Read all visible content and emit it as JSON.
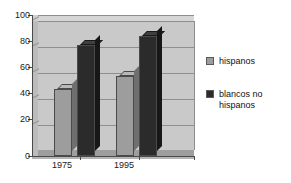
{
  "chart_data": {
    "type": "bar",
    "title": "",
    "subtitle": "",
    "xlabel": "",
    "ylabel": "",
    "categories": [
      "1975",
      "1995"
    ],
    "series": [
      {
        "name": "hispanos",
        "values": [
          52,
          62
        ],
        "color": "#9d9d9d"
      },
      {
        "name": "blancos no hispanos",
        "values": [
          86,
          93
        ],
        "color": "#2b2b2b"
      }
    ],
    "ylim": [
      0,
      100
    ],
    "yticks": [
      0,
      20,
      40,
      60,
      80,
      100
    ],
    "ytick_labels": [
      "0",
      "20",
      "40",
      "60",
      "80",
      "100"
    ],
    "grid": true,
    "legend_position": "right",
    "style_3d": true
  },
  "legend": {
    "entries": [
      {
        "label": "hispanos",
        "line1": "hispanos",
        "line2": ""
      },
      {
        "label": "blancos no hispanos",
        "line1": "blancos no",
        "line2": "hispanos"
      }
    ]
  },
  "axis": {
    "y_labels": [
      "100",
      "80",
      "60",
      "40",
      "20",
      "0"
    ],
    "x_labels": [
      "1975",
      "1995"
    ]
  },
  "colors": {
    "plot_wall": "#c9c9c9",
    "gridline": "#8e8e8e",
    "axis": "#4a4a4a",
    "series_light": "#9d9d9d",
    "series_dark": "#2b2b2b",
    "background": "#ffffff"
  }
}
